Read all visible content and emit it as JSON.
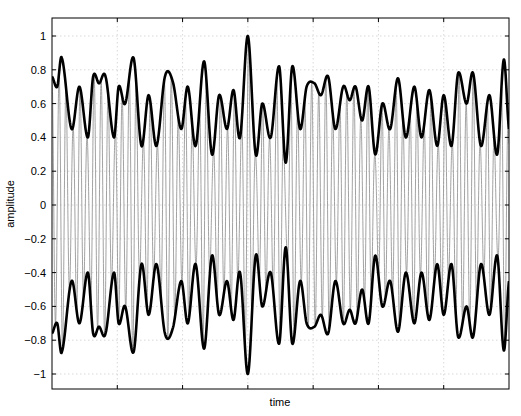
{
  "chart_data": {
    "type": "line",
    "title": "",
    "xlabel": "time",
    "ylabel": "amplitude",
    "ylim": [
      -1.1,
      1.1
    ],
    "xlim": [
      0,
      7
    ],
    "y_ticks": [
      -1,
      -0.8,
      -0.6,
      -0.4,
      -0.2,
      0,
      0.2,
      0.4,
      0.6,
      0.8,
      1
    ],
    "y_tick_labels": [
      "-1",
      "-0.8",
      "-0.6",
      "-0.4",
      "-0.2",
      "0",
      "0.2",
      "0.4",
      "0.6",
      "0.8",
      "1"
    ],
    "x_ticks": [
      1,
      2,
      3,
      4,
      5,
      6
    ],
    "x_tick_labels": [],
    "grid": true,
    "legend": null,
    "series": [
      {
        "name": "signal",
        "style": "thin gray oscillating carrier",
        "color": "#8a8a8a",
        "description": "rapidly oscillating waveform bounded by the envelope"
      },
      {
        "name": "envelope (upper)",
        "style": "bold black",
        "color": "#000000",
        "x": [
          0.0,
          0.08,
          0.15,
          0.3,
          0.42,
          0.55,
          0.63,
          0.72,
          0.82,
          0.95,
          1.02,
          1.12,
          1.25,
          1.37,
          1.48,
          1.6,
          1.73,
          1.85,
          1.98,
          2.08,
          2.2,
          2.33,
          2.45,
          2.56,
          2.68,
          2.78,
          2.88,
          3.0,
          3.12,
          3.22,
          3.35,
          3.48,
          3.58,
          3.68,
          3.8,
          3.9,
          4.02,
          4.12,
          4.23,
          4.34,
          4.46,
          4.56,
          4.65,
          4.75,
          4.85,
          4.95,
          5.06,
          5.18,
          5.3,
          5.42,
          5.55,
          5.66,
          5.78,
          5.9,
          6.0,
          6.12,
          6.22,
          6.35,
          6.45,
          6.57,
          6.7,
          6.82,
          6.92,
          7.0
        ],
        "y": [
          0.76,
          0.7,
          0.87,
          0.45,
          0.7,
          0.4,
          0.76,
          0.72,
          0.76,
          0.4,
          0.7,
          0.6,
          0.87,
          0.35,
          0.65,
          0.35,
          0.76,
          0.73,
          0.45,
          0.7,
          0.35,
          0.85,
          0.3,
          0.65,
          0.45,
          0.68,
          0.4,
          1.0,
          0.3,
          0.6,
          0.4,
          0.82,
          0.25,
          0.82,
          0.45,
          0.7,
          0.72,
          0.65,
          0.76,
          0.45,
          0.7,
          0.62,
          0.7,
          0.5,
          0.7,
          0.3,
          0.6,
          0.45,
          0.75,
          0.4,
          0.7,
          0.4,
          0.68,
          0.35,
          0.65,
          0.35,
          0.78,
          0.6,
          0.78,
          0.35,
          0.65,
          0.3,
          0.86,
          0.45
        ]
      },
      {
        "name": "envelope (lower)",
        "style": "bold black, mirror of upper envelope",
        "color": "#000000",
        "mirror_of": "envelope (upper)"
      }
    ]
  }
}
